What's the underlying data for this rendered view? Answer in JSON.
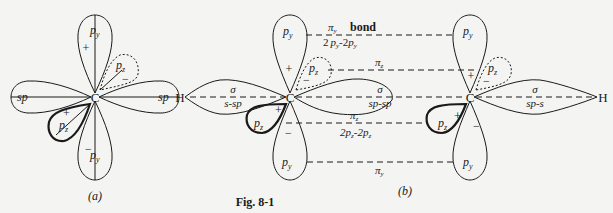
{
  "figure": {
    "caption": "Fig. 8-1",
    "panel_a": {
      "label": "(a)",
      "atom": "C",
      "orbitals": {
        "py_top": "p",
        "py_top_sub": "y",
        "py_bottom": "p",
        "py_bottom_sub": "y",
        "pz_upper": "p",
        "pz_upper_sub": "z",
        "pz_lower": "p",
        "pz_lower_sub": "z",
        "sp_left": "sp",
        "sp_right": "sp"
      },
      "signs": {
        "py_top": "+",
        "py_bottom": "−",
        "pz_upper": "−",
        "pz_lower": "+"
      }
    },
    "panel_b": {
      "label": "(b)",
      "atoms": [
        "H",
        "C",
        "C",
        "H"
      ],
      "bonds": {
        "sigma_left": {
          "symbol": "σ",
          "type": "s-sp"
        },
        "sigma_center": {
          "symbol": "σ",
          "type": "sp-sp"
        },
        "sigma_right": {
          "symbol": "σ",
          "type": "sp-s"
        },
        "pi_y_top": {
          "symbol": "π",
          "sub": "y",
          "word": "bond",
          "type_a": "2",
          "type_b": "p",
          "type_sub": "y",
          "type_sep": "-2",
          "full": "2p_y-2p_y"
        },
        "pi_z_upper": {
          "symbol": "π",
          "sub": "z"
        },
        "pi_z_lower": {
          "symbol": "π",
          "sub": "z",
          "type_prefix": "2p",
          "type_sub": "z",
          "type_mid": "-2p",
          "full": "2p_z-2p_z"
        },
        "pi_y_bottom": {
          "symbol": "π",
          "sub": "y"
        }
      },
      "orbital_p": "p",
      "sub_y": "y",
      "sub_z": "z",
      "plus": "+",
      "minus": "−"
    }
  }
}
